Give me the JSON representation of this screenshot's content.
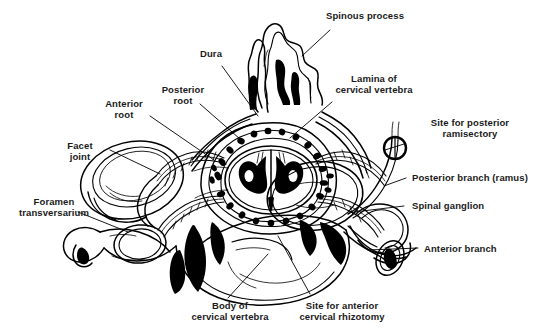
{
  "figure": {
    "background_color": "#ffffff",
    "ink_color": "#000000",
    "width": 544,
    "height": 335
  },
  "labels": {
    "spinous_process": "Spinous process",
    "dura": "Dura",
    "posterior_root": "Posterior\nroot",
    "anterior_root": "Anterior\nroot",
    "facet_joint": "Facet\njoint",
    "foramen_transversarium": "Foramen\ntransversarium",
    "lamina_of_cervical_vertebra": "Lamina of\ncervical vertebra",
    "site_for_posterior_ramisectory": "Site for posterior\nramisectory",
    "posterior_branch_ramus": "Posterior branch (ramus)",
    "spinal_ganglion": "Spinal ganglion",
    "anterior_branch": "Anterior branch",
    "body_of_cervical_vertebra": "Body of\ncervical vertebra",
    "site_for_anterior_cervical_rhizotomy": "Site for anterior\ncervical rhizotomy"
  }
}
